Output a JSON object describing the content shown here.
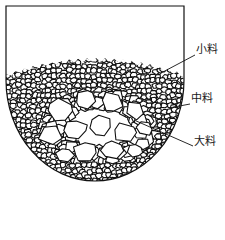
{
  "diagram": {
    "type": "furnace-charge-layering",
    "colors": {
      "stroke": "#111111",
      "fill": "#ffffff",
      "background": "#ffffff"
    },
    "container": {
      "left": 6,
      "right": 184,
      "top": 6,
      "wall_bottom": 80,
      "bowl_bottom": 181
    },
    "labels": [
      {
        "id": "small",
        "text": "小料",
        "x": 196,
        "y": 49,
        "line": [
          [
            161,
            73
          ],
          [
            195,
            55
          ]
        ]
      },
      {
        "id": "medium",
        "text": "中料",
        "x": 191,
        "y": 98,
        "line": [
          [
            169,
            108
          ],
          [
            190,
            104
          ]
        ]
      },
      {
        "id": "large",
        "text": "大料",
        "x": 194,
        "y": 140,
        "line": [
          [
            134,
            120
          ],
          [
            193,
            146
          ]
        ]
      }
    ]
  }
}
